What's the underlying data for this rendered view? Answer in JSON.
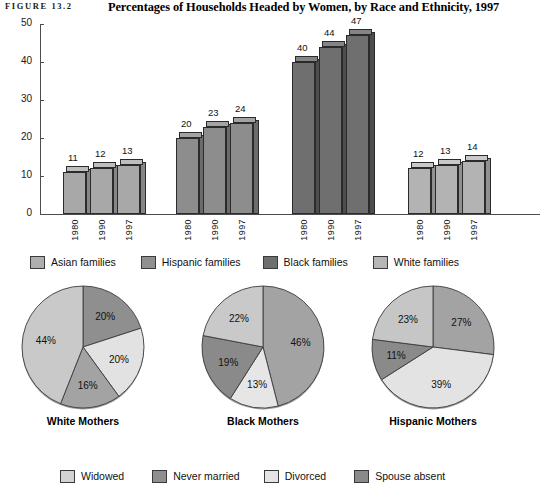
{
  "header": {
    "figure_label": "FIGURE 13.2",
    "title": "Percentages of Households Headed by Women, by Race and Ethnicity, 1997"
  },
  "chart_data": [
    {
      "type": "bar",
      "title": "Percentages of Households Headed by Women, by Race and Ethnicity, 1997",
      "xlabel": "",
      "ylabel": "",
      "ylim": [
        0,
        50
      ],
      "yticks": [
        0,
        10,
        20,
        30,
        40,
        50
      ],
      "grid": false,
      "categories": [
        "Asian families",
        "Hispanic families",
        "Black families",
        "White families"
      ],
      "x": [
        "1980",
        "1990",
        "1997"
      ],
      "groups": [
        {
          "name": "Asian families",
          "color": "#a8a8a8",
          "x": [
            "1980",
            "1990",
            "1997"
          ],
          "values": [
            11,
            12,
            13
          ]
        },
        {
          "name": "Hispanic families",
          "color": "#8d8d8d",
          "x": [
            "1980",
            "1990",
            "1997"
          ],
          "values": [
            20,
            23,
            24
          ]
        },
        {
          "name": "Black families",
          "color": "#6f6f6f",
          "x": [
            "1980",
            "1990",
            "1997"
          ],
          "values": [
            40,
            44,
            47
          ]
        },
        {
          "name": "White families",
          "color": "#b3b3b3",
          "x": [
            "1980",
            "1990",
            "1997"
          ],
          "values": [
            12,
            13,
            14
          ]
        }
      ],
      "legend_position": "bottom",
      "legend": [
        {
          "label": "Asian families",
          "color": "#a8a8a8"
        },
        {
          "label": "Hispanic families",
          "color": "#8d8d8d"
        },
        {
          "label": "Black families",
          "color": "#6f6f6f"
        },
        {
          "label": "White families",
          "color": "#b3b3b3"
        }
      ]
    },
    {
      "type": "pie",
      "title": "White Mothers",
      "labels": [
        "Never married",
        "Divorced",
        "Spouse absent",
        "Widowed"
      ],
      "values": [
        20,
        20,
        16,
        44
      ],
      "value_labels": [
        "20%",
        "20%",
        "16%",
        "44%"
      ],
      "colors": [
        "#8f8f8f",
        "#e2e2e2",
        "#a3a3a3",
        "#c9c9c9"
      ]
    },
    {
      "type": "pie",
      "title": "Black Mothers",
      "labels": [
        "Never married",
        "Divorced",
        "Spouse absent",
        "Widowed"
      ],
      "values": [
        46,
        13,
        19,
        22
      ],
      "value_labels": [
        "46%",
        "13%",
        "19%",
        "22%"
      ],
      "colors": [
        "#a3a3a3",
        "#e6e6e6",
        "#8a8a8a",
        "#c9c9c9"
      ]
    },
    {
      "type": "pie",
      "title": "Hispanic Mothers",
      "labels": [
        "Never married",
        "Divorced",
        "Spouse absent",
        "Widowed"
      ],
      "values": [
        27,
        39,
        11,
        23
      ],
      "value_labels": [
        "27%",
        "39%",
        "11%",
        "23%"
      ],
      "colors": [
        "#a3a3a3",
        "#e3e3e3",
        "#8a8a8a",
        "#c6c6c6"
      ]
    }
  ],
  "bar_legend": {
    "items": [
      {
        "label": "Asian families",
        "color": "#aeaeae"
      },
      {
        "label": "Hispanic families",
        "color": "#909090"
      },
      {
        "label": "Black families",
        "color": "#6f6f6f"
      },
      {
        "label": "White families",
        "color": "#b6b6b6"
      }
    ]
  },
  "pie_legend": {
    "items": [
      {
        "label": "Widowed",
        "color": "#d3d3d3"
      },
      {
        "label": "Never married",
        "color": "#8f8f8f"
      },
      {
        "label": "Divorced",
        "color": "#e4e4e4"
      },
      {
        "label": "Spouse absent",
        "color": "#8a8a8a"
      }
    ]
  },
  "axis": {
    "y_labels": [
      "50",
      "40",
      "30",
      "20",
      "10",
      "0"
    ]
  },
  "pie_captions": [
    "White Mothers",
    "Black Mothers",
    "Hispanic Mothers"
  ]
}
